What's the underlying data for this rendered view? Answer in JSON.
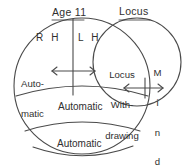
{
  "diagram": {
    "title_top_left": "Age 11",
    "title_top_right": "Locus",
    "hemisphere_right": "R H",
    "hemisphere_left": "L H",
    "automatic_upper_left_line1": "Auto-",
    "automatic_upper_left_line2": "matic",
    "locus_withdrawing_line1": "Locus",
    "locus_withdrawing_line2": "With-",
    "locus_withdrawing_line3": "drawing",
    "mind_letter_1": "M",
    "mind_letter_2": "i",
    "mind_letter_3": "n",
    "mind_letter_4": "d",
    "band_middle_label": "Automatic",
    "band_bottom_label": "Automatic",
    "stroke_color": "#4a4a4a",
    "text_color": "#2f2f2f",
    "background_color": "#ffffff"
  }
}
